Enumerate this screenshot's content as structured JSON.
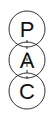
{
  "diagram": {
    "nodes": [
      {
        "label": "P",
        "cx": 27,
        "cy": 29
      },
      {
        "label": "A",
        "cx": 27,
        "cy": 60
      },
      {
        "label": "C",
        "cx": 27,
        "cy": 91
      }
    ],
    "radius": 18,
    "stroke_color": "#333333",
    "connector": "dashed-vertical-line"
  }
}
